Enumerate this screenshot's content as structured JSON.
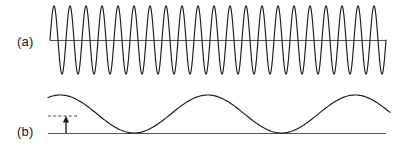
{
  "figure": {
    "background_color": "#ffffff",
    "stroke_color": "#1a1a1a",
    "axis_color": "#555555",
    "width": 402,
    "height": 153
  },
  "panels": [
    {
      "id": "a",
      "label": "(a)",
      "label_x": 17,
      "label_y": 35,
      "description": "High-frequency carrier sine wave oscillating symmetrically about a horizontal axis"
    },
    {
      "id": "b",
      "label": "(b)",
      "label_x": 17,
      "label_y": 125,
      "description": "Low-frequency sine wave resting on a baseline with a dashed reference level and an amplitude arrow"
    }
  ],
  "annotations": {
    "dashed_reference_line": {
      "name": "amplitude-reference-line",
      "x_start": 48,
      "x_end": 78,
      "y": 116
    },
    "amplitude_arrow": {
      "name": "amplitude-arrow",
      "x": 66,
      "y_base": 133,
      "y_tip": 116
    }
  },
  "chart_data": [
    {
      "type": "line",
      "id": "panel-a-carrier",
      "title": "(a)",
      "xlabel": "",
      "ylabel": "",
      "grid": false,
      "legend": "none",
      "axis_y_pixel": 40,
      "x_start_pixel": 50,
      "x_end_pixel": 386,
      "cycles": 21,
      "amplitude_pixels": 34,
      "baseline_offset": 0,
      "waveform": "sine",
      "phase_deg": 0,
      "samples_per_cycle": 48,
      "axis_drawn": true,
      "xlim": [
        0,
        21
      ],
      "ylim": [
        -1,
        1
      ],
      "description": "Constant-amplitude high-frequency sinusoid (carrier)"
    },
    {
      "type": "line",
      "id": "panel-b-envelope",
      "title": "(b)",
      "xlabel": "",
      "ylabel": "",
      "grid": false,
      "legend": "none",
      "axis_y_pixel": 133,
      "x_start_pixel": 48,
      "x_end_pixel": 390,
      "cycles": 2.32,
      "amplitude_pixels": 19,
      "baseline_offset_pixels": 19,
      "peak_y_pixel": 95,
      "waveform": "raised-sine",
      "phase_deg": 60,
      "samples_per_cycle": 160,
      "axis_drawn": true,
      "xlim": [
        0,
        2.32
      ],
      "ylim": [
        0,
        1
      ],
      "description": "Low-frequency sinusoid riding on a baseline, touching zero at its minima"
    }
  ]
}
